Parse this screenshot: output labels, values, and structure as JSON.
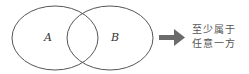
{
  "diagram": {
    "set_a_label": "A",
    "set_b_label": "B",
    "result_line1": "至少属于",
    "result_line2": "任意一方",
    "arrow_color": "#6b6b6b",
    "stroke_color": "#555555"
  }
}
